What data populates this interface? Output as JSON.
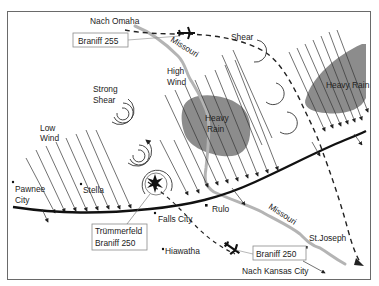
{
  "labels": {
    "nach_omaha": "Nach Omaha",
    "braniff_255": "Braniff 255",
    "missouri_north": "Missouri",
    "missouri_south": "Missouri",
    "shear": "Shear",
    "high_wind_1": "High",
    "high_wind_2": "Wind",
    "strong_shear_1": "Strong",
    "strong_shear_2": "Shear",
    "low_wind_1": "Low",
    "low_wind_2": "Wind",
    "heavy_rain_center_1": "Heavy",
    "heavy_rain_center_2": "Rain",
    "heavy_rain_east": "Heavy Rain",
    "pawnee_1": "Pawnee",
    "pawnee_2": "City",
    "stella": "Stella",
    "falls_city": "Falls City",
    "rulo": "Rulo",
    "st_joseph": "St.Joseph",
    "hiawatha": "Hiawatha",
    "truemmerfeld_1": "Trümmerfeld",
    "truemmerfeld_2": "Braniff 250",
    "braniff_250": "Braniff 250",
    "nach_kansas_city": "Nach Kansas City"
  },
  "colors": {
    "rain_fill": "#8c8c8c",
    "river": "#b4b4b4",
    "front": "#111111",
    "frame": "#6a6a6a"
  }
}
